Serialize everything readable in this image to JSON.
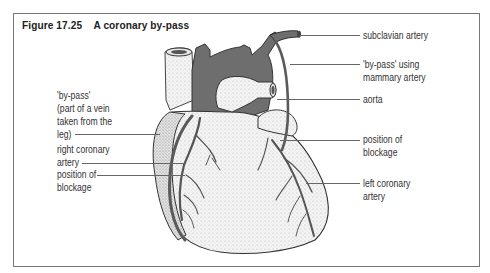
{
  "figure": {
    "number": "Figure 17.25",
    "title": "A coronary by-pass"
  },
  "labels_left": [
    {
      "id": "bypass-vein",
      "lines": [
        "'by-pass'",
        "(part of a vein",
        "taken from the",
        "leg)"
      ]
    },
    {
      "id": "right-coronary-artery",
      "lines": [
        "right coronary",
        "artery"
      ]
    },
    {
      "id": "position-of-blockage-left",
      "lines": [
        "position of",
        "blockage"
      ]
    }
  ],
  "labels_right": [
    {
      "id": "subclavian-artery",
      "lines": [
        "subclavian artery"
      ]
    },
    {
      "id": "bypass-mammary",
      "lines": [
        "'by-pass' using",
        "mammary artery"
      ]
    },
    {
      "id": "aorta",
      "lines": [
        "aorta"
      ]
    },
    {
      "id": "position-of-blockage-right",
      "lines": [
        "position of",
        "blockage"
      ]
    },
    {
      "id": "left-coronary-artery",
      "lines": [
        "left coronary",
        "artery"
      ]
    }
  ],
  "colors": {
    "frame": "#777777",
    "aorta_fill": "#6e6e6e",
    "heart_fill": "#f2f2f2",
    "stipple": "#9a9a9a",
    "vessel": "#5a5a5a",
    "text": "#333333"
  }
}
